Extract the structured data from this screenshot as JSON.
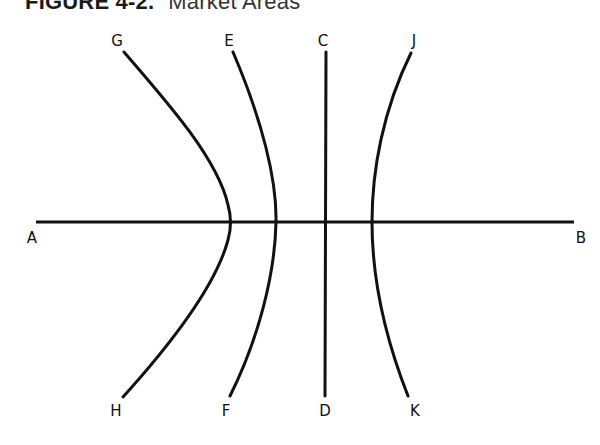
{
  "figure": {
    "number": "FIGURE 4-2.",
    "caption": "Market Areas"
  },
  "diagram": {
    "colors": {
      "line": "#111111",
      "background": "#ffffff"
    },
    "axis": {
      "name": "A-B",
      "start": {
        "label": "A",
        "x": 36,
        "y": 222,
        "label_x": 32,
        "label_y": 238
      },
      "end": {
        "label": "B",
        "x": 574,
        "y": 222,
        "label_x": 581,
        "label_y": 238
      }
    },
    "lines": [
      {
        "name": "G-H",
        "type": "hyperbola-branch",
        "top": {
          "label": "G",
          "x": 124,
          "y": 52,
          "label_x": 117,
          "label_y": 41
        },
        "bottom": {
          "label": "H",
          "x": 123,
          "y": 397,
          "label_x": 116,
          "label_y": 411
        },
        "path": "M124,52 C170,105 218,160 228,205 Q233,222 228,240 C216,285 170,345 123,397"
      },
      {
        "name": "E-F",
        "type": "hyperbola-branch",
        "top": {
          "label": "E",
          "x": 233,
          "y": 52,
          "label_x": 229,
          "label_y": 41
        },
        "bottom": {
          "label": "F",
          "x": 230,
          "y": 396,
          "label_x": 226,
          "label_y": 411
        },
        "path": "M233,52 C262,120 277,180 276,222 C275,275 258,340 230,396"
      },
      {
        "name": "C-D",
        "type": "straight",
        "top": {
          "label": "C",
          "x": 326,
          "y": 52,
          "label_x": 323,
          "label_y": 41
        },
        "bottom": {
          "label": "D",
          "x": 325,
          "y": 396,
          "label_x": 325,
          "label_y": 411
        },
        "path": "M326,52 L325,396"
      },
      {
        "name": "J-K",
        "type": "hyperbola-branch",
        "top": {
          "label": "J",
          "x": 411,
          "y": 53,
          "label_x": 414,
          "label_y": 41
        },
        "bottom": {
          "label": "K",
          "x": 408,
          "y": 396,
          "label_x": 415,
          "label_y": 411
        },
        "path": "M411,53 C383,110 372,170 372,222 C372,280 386,340 408,396"
      }
    ]
  }
}
